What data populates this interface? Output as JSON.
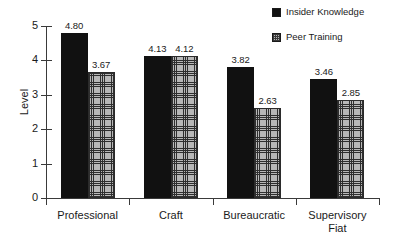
{
  "chart_data": {
    "type": "bar",
    "title": "",
    "xlabel": "",
    "ylabel": "Level",
    "ylim": [
      0,
      5
    ],
    "yticks": [
      0,
      1,
      2,
      3,
      4,
      5
    ],
    "ytick_labels": [
      "0",
      "1",
      "2",
      "3",
      "4",
      "5"
    ],
    "grid": false,
    "legend_position": "top-right",
    "categories": [
      "Professional",
      "Craft",
      "Bureaucratic",
      "Supervisory Fiat"
    ],
    "category_lines": [
      [
        "Professional"
      ],
      [
        "Craft"
      ],
      [
        "Bureaucratic"
      ],
      [
        "Supervisory",
        "Fiat"
      ]
    ],
    "series": [
      {
        "name": "Insider Knowledge",
        "color": "#111111",
        "fill": "solid",
        "values": [
          4.8,
          4.13,
          3.82,
          3.46
        ],
        "labels": [
          "4.80",
          "4.13",
          "3.82",
          "3.46"
        ]
      },
      {
        "name": "Peer Training",
        "color": "#b8b8b8",
        "fill": "cross-hatch",
        "values": [
          3.67,
          4.12,
          2.63,
          2.85
        ],
        "labels": [
          "3.67",
          "4.12",
          "2.63",
          "2.85"
        ]
      }
    ]
  }
}
